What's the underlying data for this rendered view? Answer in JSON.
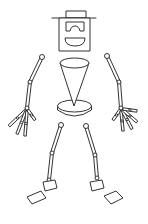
{
  "figure": {
    "width": 148,
    "height": 224,
    "colors": {
      "stroke": "#333333",
      "background": "#ffffff",
      "fill": "#ffffff"
    },
    "head": {
      "hat_top": {
        "x": 66,
        "y": 11,
        "w": 20,
        "h": 7
      },
      "hat_brim": {
        "x1": 52,
        "y1": 18,
        "x2": 96,
        "y2": 18
      },
      "face_box": {
        "x": 59,
        "y": 18,
        "w": 31,
        "h": 33
      },
      "glasses": "M66 22 L84 22 L84 31 L80 31 Q79 26 75 26 Q71 26 70 31 L66 31 Z",
      "mouth": "M65 38 L85 38 Q85 46 75 46 Q65 46 65 38 Z"
    },
    "torso": {
      "cone_top": {
        "cx": 74.5,
        "cy": 63,
        "rx": 14.5,
        "ry": 5
      },
      "cone_sides": "M60 63 L74 106 L89 63",
      "base_top": {
        "cx": 74.5,
        "cy": 106,
        "rx": 17,
        "ry": 6
      },
      "base_side": "M57.5 106 L57.5 110 Q74.5 122 91.5 110 L91.5 106"
    },
    "limbs": {
      "left_arm": {
        "shoulder": [
          42,
          57
        ],
        "elbow": [
          30,
          82
        ],
        "wrist": [
          27,
          108
        ]
      },
      "right_arm": {
        "shoulder": [
          107,
          56
        ],
        "elbow": [
          119,
          82
        ],
        "wrist": [
          121,
          108
        ]
      },
      "left_leg": {
        "hip": [
          61,
          125
        ],
        "knee": [
          52,
          153
        ],
        "ankle": [
          49,
          180
        ]
      },
      "right_leg": {
        "hip": [
          86,
          126
        ],
        "knee": [
          95,
          155
        ],
        "ankle": [
          97,
          178
        ]
      }
    },
    "hands": {
      "left_fingers": [
        {
          "x1": 26,
          "y1": 110,
          "x2": 9,
          "y2": 126
        },
        {
          "x1": 26,
          "y1": 111,
          "x2": 17,
          "y2": 134
        },
        {
          "x1": 27,
          "y1": 111,
          "x2": 25,
          "y2": 136
        },
        {
          "x1": 28,
          "y1": 110,
          "x2": 35,
          "y2": 120
        }
      ],
      "right_fingers": [
        {
          "x1": 120,
          "y1": 110,
          "x2": 113,
          "y2": 120
        },
        {
          "x1": 121,
          "y1": 111,
          "x2": 123,
          "y2": 131
        },
        {
          "x1": 122,
          "y1": 110,
          "x2": 132,
          "y2": 129
        },
        {
          "x1": 123,
          "y1": 110,
          "x2": 137,
          "y2": 122
        },
        {
          "x1": 123,
          "y1": 109,
          "x2": 137,
          "y2": 111
        }
      ]
    },
    "feet": {
      "left_ankle_block": "M43 182 L55 180 L57 188 L45 191 Z",
      "left_shoe": "M27 197 L41 191 L46 198 L32 204 Z",
      "right_ankle_block": "M90 182 L102 180 L104 188 L92 191 Z",
      "right_shoe": "M104 196 L116 191 L123 198 L111 204 Z"
    }
  }
}
